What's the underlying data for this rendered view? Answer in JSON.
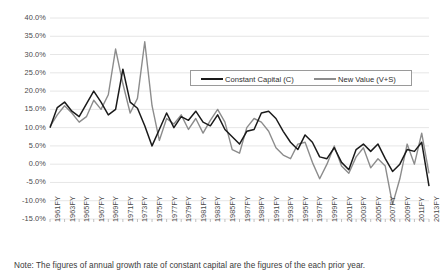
{
  "chart_data": {
    "type": "line",
    "title": "",
    "xlabel": "",
    "ylabel": "",
    "ylim": [
      -15,
      40
    ],
    "ytick_step": 5,
    "grid": true,
    "legend_position": "top-center",
    "ytick_labels": [
      "40.0%",
      "35.0%",
      "30.0%",
      "25.0%",
      "20.0%",
      "15.0%",
      "10.0%",
      "5.0%",
      "0.0%",
      "-5.0%",
      "-10.0%",
      "-15.0%"
    ],
    "ytick_values": [
      40,
      35,
      30,
      25,
      20,
      15,
      10,
      5,
      0,
      -5,
      -10,
      -15
    ],
    "categories": [
      "1961FY",
      "1962FY",
      "1963FY",
      "1964FY",
      "1965FY",
      "1966FY",
      "1967FY",
      "1968FY",
      "1969FY",
      "1970FY",
      "1971FY",
      "1972FY",
      "1973FY",
      "1974FY",
      "1975FY",
      "1976FY",
      "1977FY",
      "1978FY",
      "1979FY",
      "1980FY",
      "1981FY",
      "1982FY",
      "1983FY",
      "1984FY",
      "1985FY",
      "1986FY",
      "1987FY",
      "1988FY",
      "1989FY",
      "1990FY",
      "1991FY",
      "1992FY",
      "1993FY",
      "1994FY",
      "1995FY",
      "1996FY",
      "1997FY",
      "1998FY",
      "1999FY",
      "2000FY",
      "2001FY",
      "2002FY",
      "2003FY",
      "2004FY",
      "2005FY",
      "2006FY",
      "2007FY",
      "2008FY",
      "2009FY",
      "2010FY",
      "2011FY",
      "2012FY",
      "2013FY"
    ],
    "xtick_labels": [
      "1961FY",
      "1963FY",
      "1965FY",
      "1967FY",
      "1969FY",
      "1971FY",
      "1973FY",
      "1975FY",
      "1977FY",
      "1979FY",
      "1981FY",
      "1983FY",
      "1985FY",
      "1987FY",
      "1989FY",
      "1991FY",
      "1993FY",
      "1995FY",
      "1997FY",
      "1999FY",
      "2001FY",
      "2003FY",
      "2005FY",
      "2007FY",
      "2009FY",
      "2011FY",
      "2013FY"
    ],
    "series": [
      {
        "name": "Constant Capital (C)",
        "color": "#1a1a1a",
        "values": [
          10.0,
          15.5,
          17.0,
          14.5,
          13.0,
          16.5,
          20.0,
          17.0,
          13.5,
          15.0,
          26.0,
          17.0,
          15.3,
          10.5,
          5.0,
          9.5,
          14.0,
          10.0,
          13.0,
          12.0,
          14.5,
          11.5,
          10.5,
          13.5,
          9.5,
          7.5,
          5.5,
          9.0,
          9.5,
          14.0,
          14.5,
          12.5,
          9.0,
          6.0,
          4.0,
          8.0,
          6.0,
          2.0,
          1.5,
          4.5,
          0.5,
          -1.5,
          4.0,
          5.5,
          3.5,
          5.5,
          1.5,
          -2.0,
          0.0,
          4.0,
          3.5,
          6.0,
          -6.0
        ]
      },
      {
        "name": "New Value (V+S)",
        "color": "#8c8c8c",
        "values": [
          10.3,
          13.5,
          16.0,
          14.0,
          11.5,
          13.0,
          17.5,
          15.0,
          19.0,
          31.5,
          22.0,
          14.0,
          18.0,
          33.5,
          16.0,
          6.5,
          12.5,
          11.0,
          13.5,
          9.5,
          12.5,
          8.5,
          12.0,
          15.0,
          11.5,
          4.0,
          3.0,
          10.0,
          12.5,
          11.5,
          9.0,
          4.5,
          2.5,
          1.5,
          5.5,
          6.0,
          0.5,
          -4.0,
          0.0,
          5.0,
          -0.5,
          -2.5,
          2.0,
          4.5,
          -1.0,
          1.5,
          -0.5,
          -11.0,
          -4.0,
          5.5,
          0.0,
          8.5,
          -2.5
        ]
      }
    ]
  },
  "note": {
    "text": "Note: The figures of annual growth rate of constant capital  are the figures of the each prior year."
  },
  "legend": {
    "items": [
      {
        "label": "Constant Capital (C)"
      },
      {
        "label": "New Value (V+S)"
      }
    ]
  }
}
